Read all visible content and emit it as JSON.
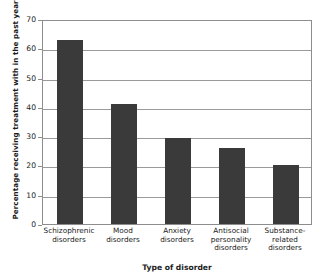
{
  "chart_data": {
    "type": "bar",
    "title": "",
    "xlabel": "Type of disorder",
    "ylabel": "Percentage receiving treatment with in the past year",
    "categories": [
      "Schizophrenic\ndisorders",
      "Mood\ndisorders",
      "Anxiety\ndisorders",
      "Antisocial\npersonality\ndisorders",
      "Substance-\nrelated\ndisorders"
    ],
    "values": [
      63,
      41,
      29.5,
      26,
      20
    ],
    "ylim": [
      0,
      70
    ],
    "yticks": [
      0,
      10,
      20,
      30,
      40,
      50,
      60,
      70
    ],
    "grid": true,
    "legend": false,
    "bar_color": "#3a3a3a",
    "axis_color": "#8d8d8d",
    "gridline_color": "#9a9a9a"
  }
}
